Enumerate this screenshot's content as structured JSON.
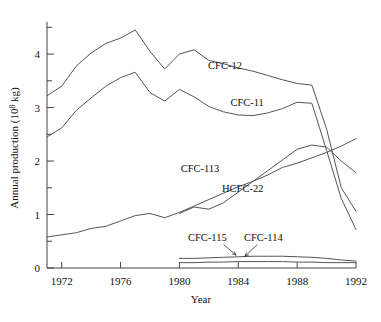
{
  "chart_data": {
    "type": "line",
    "title": "",
    "xlabel": "Year",
    "ylabel": "Annual production (10",
    "ylabel_sup": "8",
    "ylabel_tail": " kg)",
    "xlim": [
      1971,
      1992
    ],
    "ylim": [
      0,
      4.6
    ],
    "xticks": [
      1972,
      1976,
      1980,
      1984,
      1988,
      1992
    ],
    "xtick_labels": [
      "1972",
      "1976",
      "1980",
      "1984",
      "1988",
      "1992"
    ],
    "yticks": [
      0,
      1,
      2,
      3,
      4
    ],
    "ytick_labels": [
      "0",
      "1",
      "2",
      "3",
      "4"
    ],
    "yminor": [
      0.5,
      1.5,
      2.5,
      3.5,
      4.5
    ],
    "grid": false,
    "legend_position": "inline-annotations",
    "series": [
      {
        "name": "CFC-12",
        "label": "CFC-12",
        "label_x": 1983.1,
        "label_y": 3.72,
        "x": [
          1971,
          1972,
          1973,
          1974,
          1975,
          1976,
          1977,
          1978,
          1979,
          1980,
          1981,
          1982,
          1983,
          1984,
          1985,
          1986,
          1987,
          1988,
          1989,
          1990,
          1991,
          1992
        ],
        "y": [
          3.22,
          3.4,
          3.78,
          4.02,
          4.2,
          4.3,
          4.45,
          4.05,
          3.72,
          4.0,
          4.08,
          3.88,
          3.82,
          3.74,
          3.68,
          3.6,
          3.52,
          3.45,
          3.42,
          2.6,
          1.5,
          1.06
        ]
      },
      {
        "name": "CFC-11",
        "label": "CFC-11",
        "label_x": 1984.6,
        "label_y": 3.02,
        "x": [
          1971,
          1972,
          1973,
          1974,
          1975,
          1976,
          1977,
          1978,
          1979,
          1980,
          1981,
          1982,
          1983,
          1984,
          1985,
          1986,
          1987,
          1988,
          1989,
          1990,
          1991,
          1992
        ],
        "y": [
          2.45,
          2.62,
          2.95,
          3.18,
          3.4,
          3.56,
          3.66,
          3.28,
          3.12,
          3.34,
          3.2,
          3.02,
          2.92,
          2.86,
          2.85,
          2.9,
          2.98,
          3.1,
          3.08,
          2.2,
          1.3,
          0.72
        ]
      },
      {
        "name": "CFC-113",
        "label": "CFC-113",
        "label_x": 1981.4,
        "label_y": 1.8,
        "x": [
          1980,
          1981,
          1982,
          1983,
          1984,
          1985,
          1986,
          1987,
          1988,
          1989,
          1990,
          1991,
          1992
        ],
        "y": [
          1.02,
          1.14,
          1.1,
          1.22,
          1.42,
          1.62,
          1.82,
          2.02,
          2.22,
          2.3,
          2.26,
          2.0,
          1.78
        ]
      },
      {
        "name": "HCFC-22",
        "label": "HCFC-22",
        "label_x": 1984.3,
        "label_y": 1.42,
        "x": [
          1971,
          1972,
          1973,
          1974,
          1975,
          1976,
          1977,
          1978,
          1979,
          1980,
          1981,
          1982,
          1983,
          1984,
          1985,
          1986,
          1987,
          1988,
          1989,
          1990,
          1991,
          1992
        ],
        "y": [
          0.58,
          0.62,
          0.66,
          0.74,
          0.78,
          0.88,
          0.98,
          1.02,
          0.94,
          1.04,
          1.16,
          1.28,
          1.4,
          1.52,
          1.62,
          1.74,
          1.88,
          1.96,
          2.06,
          2.16,
          2.28,
          2.42
        ]
      },
      {
        "name": "CFC-115",
        "label": "CFC-115",
        "label_x": 1981.9,
        "label_y": 0.5,
        "x": [
          1980,
          1981,
          1982,
          1983,
          1984,
          1985,
          1986,
          1987,
          1988,
          1989,
          1990,
          1991,
          1992
        ],
        "y": [
          0.18,
          0.18,
          0.19,
          0.2,
          0.21,
          0.22,
          0.22,
          0.22,
          0.21,
          0.2,
          0.18,
          0.15,
          0.13
        ]
      },
      {
        "name": "CFC-114",
        "label": "CFC-114",
        "label_x": 1985.7,
        "label_y": 0.5,
        "x": [
          1980,
          1981,
          1982,
          1983,
          1984,
          1985,
          1986,
          1987,
          1988,
          1989,
          1990,
          1991,
          1992
        ],
        "y": [
          0.1,
          0.1,
          0.11,
          0.11,
          0.12,
          0.12,
          0.12,
          0.12,
          0.11,
          0.11,
          0.1,
          0.1,
          0.1
        ]
      }
    ],
    "annotations": [
      {
        "name": "cfc115-leader",
        "from_x": 1983.0,
        "from_y": 0.44,
        "to_x": 1983.85,
        "to_y": 0.24
      },
      {
        "name": "cfc114-leader",
        "from_x": 1985.3,
        "from_y": 0.44,
        "to_x": 1984.45,
        "to_y": 0.22
      }
    ]
  }
}
